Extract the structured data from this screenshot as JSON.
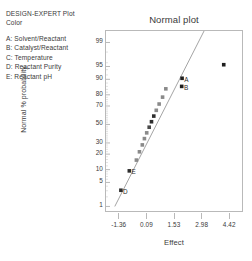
{
  "legend": {
    "title": "DESIGN-EXPERT Plot",
    "subtitle": "Color",
    "items": [
      {
        "key": "A",
        "label": "A: Solvent/Reactant"
      },
      {
        "key": "B",
        "label": "B: Catalyst/Reactant"
      },
      {
        "key": "C",
        "label": "C: Temperature"
      },
      {
        "key": "D",
        "label": "D: Reactant Purity"
      },
      {
        "key": "E",
        "label": "E: Reactant pH"
      }
    ]
  },
  "chart_data": {
    "type": "scatter",
    "title": "Normal plot",
    "xlabel": "Effect",
    "ylabel": "Normal % probability",
    "grid": false,
    "legend_position": "outside-left",
    "xlim": [
      -2.08,
      5.14
    ],
    "xticks": [
      -1.36,
      0.09,
      1.53,
      2.98,
      4.42
    ],
    "xtick_labels": [
      "-1.36",
      "0.09",
      "1.53",
      "2.98",
      "4.42"
    ],
    "ylim_percent": [
      0.6,
      99.6
    ],
    "yticks": [
      1,
      5,
      10,
      20,
      30,
      50,
      70,
      80,
      90,
      95,
      99
    ],
    "ytick_labels": [
      "1",
      "5",
      "10",
      "20",
      "30",
      "50",
      "70",
      "80",
      "90",
      "95",
      "99"
    ],
    "reference_line": {
      "x_start": -1.62,
      "y_start": 1.0,
      "x_end": 3.05,
      "y_end": 99.6
    },
    "points": [
      {
        "effect": -1.3,
        "probability": 3.1,
        "label": "D",
        "shade": "#2d2d2d"
      },
      {
        "effect": -0.86,
        "probability": 9.4,
        "label": "E",
        "shade": "#2d2d2d"
      },
      {
        "effect": -0.49,
        "probability": 15.6,
        "label": "",
        "shade": "#8a8a8a"
      },
      {
        "effect": -0.33,
        "probability": 21.9,
        "label": "",
        "shade": "#8a8a8a"
      },
      {
        "effect": -0.18,
        "probability": 28.1,
        "label": "",
        "shade": "#8a8a8a"
      },
      {
        "effect": -0.07,
        "probability": 34.4,
        "label": "",
        "shade": "#8a8a8a"
      },
      {
        "effect": 0.05,
        "probability": 40.6,
        "label": "",
        "shade": "#8a8a8a"
      },
      {
        "effect": 0.18,
        "probability": 46.9,
        "label": "",
        "shade": "#4a4a4a"
      },
      {
        "effect": 0.3,
        "probability": 53.1,
        "label": "",
        "shade": "#2d2d2d"
      },
      {
        "effect": 0.42,
        "probability": 59.4,
        "label": "",
        "shade": "#2d2d2d"
      },
      {
        "effect": 0.55,
        "probability": 65.6,
        "label": "",
        "shade": "#8a8a8a"
      },
      {
        "effect": 0.7,
        "probability": 71.9,
        "label": "",
        "shade": "#8a8a8a"
      },
      {
        "effect": 0.88,
        "probability": 78.1,
        "label": "",
        "shade": "#8a8a8a"
      },
      {
        "effect": 1.05,
        "probability": 84.4,
        "label": "",
        "shade": "#8a8a8a"
      },
      {
        "effect": 1.88,
        "probability": 86.0,
        "label": "B",
        "shade": "#1f1f1f"
      },
      {
        "effect": 1.9,
        "probability": 90.5,
        "label": "A",
        "shade": "#1f1f1f"
      },
      {
        "effect": 4.08,
        "probability": 95.5,
        "label": "",
        "shade": "#1f1f1f"
      }
    ]
  },
  "colors": {
    "frame": "#b9b9b9",
    "axis_text": "#3a3a3a",
    "line": "#9a9a9a",
    "marker_dark": "#2d2d2d",
    "marker_light": "#8a8a8a"
  }
}
